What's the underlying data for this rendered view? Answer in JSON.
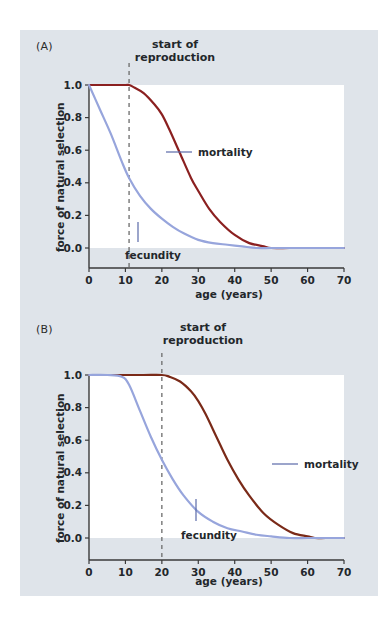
{
  "figure": {
    "background_color": "#dfe4ea",
    "page_color": "#ffffff",
    "panels": [
      {
        "id": "A",
        "letter": "(A)",
        "annotation_label_line1": "start of",
        "annotation_label_line2": "reproduction"
      },
      {
        "id": "B",
        "letter": "(B)",
        "annotation_label_line1": "start of",
        "annotation_label_line2": "reproduction"
      }
    ]
  },
  "chart_data": [
    {
      "type": "line",
      "id": "panel-A",
      "title": "(A)",
      "xlabel": "age (years)",
      "ylabel": "force of natural selection",
      "xlim": [
        0,
        70
      ],
      "ylim": [
        0.0,
        1.0
      ],
      "xticks": [
        0,
        10,
        20,
        30,
        40,
        50,
        60,
        70
      ],
      "xtick_labels": [
        "0",
        "10",
        "20",
        "30",
        "40",
        "50",
        "60",
        "70"
      ],
      "yticks": [
        0.0,
        0.2,
        0.4,
        0.6,
        0.8,
        1.0
      ],
      "ytick_labels": [
        "0.0",
        "0.2",
        "0.4",
        "0.6",
        "0.8",
        "1.0"
      ],
      "grid": false,
      "legend_position": "inline-annotation",
      "annotations": [
        {
          "name": "start-of-reproduction",
          "text": "start of reproduction",
          "x": 11,
          "style": "vertical dashed line"
        }
      ],
      "series": [
        {
          "name": "mortality",
          "color": "#8b2020",
          "x": [
            0,
            5,
            10,
            11,
            12,
            15,
            18,
            20,
            22,
            25,
            28,
            30,
            33,
            36,
            40,
            44,
            48,
            50,
            55,
            60,
            65,
            70
          ],
          "values": [
            1.0,
            1.0,
            1.0,
            1.0,
            0.99,
            0.95,
            0.88,
            0.82,
            0.73,
            0.58,
            0.43,
            0.35,
            0.24,
            0.16,
            0.08,
            0.03,
            0.01,
            0.0,
            0.0,
            0.0,
            0.0,
            0.0
          ]
        },
        {
          "name": "fecundity",
          "color": "#97a5dc",
          "x": [
            0,
            3,
            6,
            9,
            11,
            14,
            17,
            20,
            23,
            26,
            30,
            34,
            38,
            42,
            46,
            50,
            55,
            60,
            65,
            70
          ],
          "values": [
            1.0,
            0.85,
            0.7,
            0.53,
            0.43,
            0.32,
            0.24,
            0.18,
            0.13,
            0.09,
            0.05,
            0.03,
            0.02,
            0.01,
            0.0,
            0.0,
            0.0,
            0.0,
            0.0,
            0.0
          ]
        }
      ]
    },
    {
      "type": "line",
      "id": "panel-B",
      "title": "(B)",
      "xlabel": "age (years)",
      "ylabel": "force of natural selection",
      "xlim": [
        0,
        70
      ],
      "ylim": [
        0.0,
        1.0
      ],
      "xticks": [
        0,
        10,
        20,
        30,
        40,
        50,
        60,
        70
      ],
      "xtick_labels": [
        "0",
        "10",
        "20",
        "30",
        "40",
        "50",
        "60",
        "70"
      ],
      "yticks": [
        0.0,
        0.2,
        0.4,
        0.6,
        0.8,
        1.0
      ],
      "ytick_labels": [
        "0.0",
        "0.2",
        "0.4",
        "0.6",
        "0.8",
        "1.0"
      ],
      "grid": false,
      "legend_position": "inline-annotation",
      "annotations": [
        {
          "name": "start-of-reproduction",
          "text": "start of reproduction",
          "x": 20,
          "style": "vertical dashed line"
        }
      ],
      "series": [
        {
          "name": "mortality",
          "color": "#7a2a18",
          "x": [
            0,
            8,
            15,
            20,
            22,
            25,
            28,
            30,
            32,
            35,
            38,
            41,
            44,
            48,
            52,
            56,
            60,
            62,
            65,
            70
          ],
          "values": [
            1.0,
            1.0,
            1.0,
            1.0,
            0.99,
            0.96,
            0.9,
            0.84,
            0.76,
            0.62,
            0.48,
            0.36,
            0.26,
            0.15,
            0.08,
            0.03,
            0.01,
            0.0,
            0.0,
            0.0
          ]
        },
        {
          "name": "fecundity",
          "color": "#97a5dc",
          "x": [
            0,
            5,
            9,
            11,
            14,
            17,
            20,
            23,
            26,
            30,
            34,
            38,
            42,
            46,
            50,
            55,
            60,
            65,
            70
          ],
          "values": [
            1.0,
            1.0,
            0.99,
            0.94,
            0.78,
            0.62,
            0.48,
            0.36,
            0.26,
            0.16,
            0.1,
            0.06,
            0.04,
            0.02,
            0.01,
            0.0,
            0.0,
            0.0,
            0.0
          ]
        }
      ]
    }
  ]
}
